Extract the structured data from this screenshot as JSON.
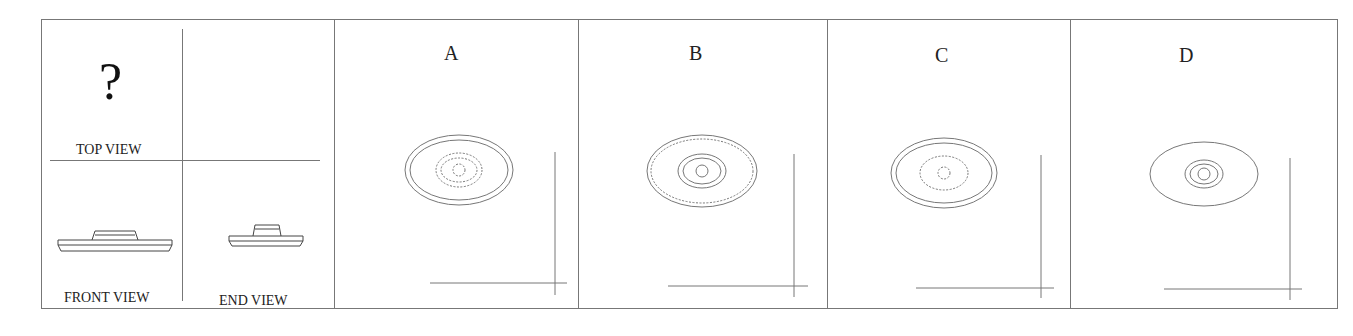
{
  "problem": {
    "question_views": {
      "top_view_label": "TOP VIEW",
      "top_view_placeholder": "?",
      "front_view_label": "FRONT VIEW",
      "end_view_label": "END VIEW"
    },
    "options": [
      {
        "letter": "A",
        "description": "outer double solid ellipse, two dashed inner ellipses, dashed center circle"
      },
      {
        "letter": "B",
        "description": "outer solid ellipse with dashed inner ellipse, two solid inner ellipses, solid center circle"
      },
      {
        "letter": "C",
        "description": "outer double solid ellipse, one dashed inner ellipse, dashed center circle"
      },
      {
        "letter": "D",
        "description": "outer solid ellipse, two solid inner ellipses, solid center circle"
      }
    ]
  },
  "colors": {
    "line": "#777777",
    "text": "#222222",
    "background": "#ffffff"
  }
}
